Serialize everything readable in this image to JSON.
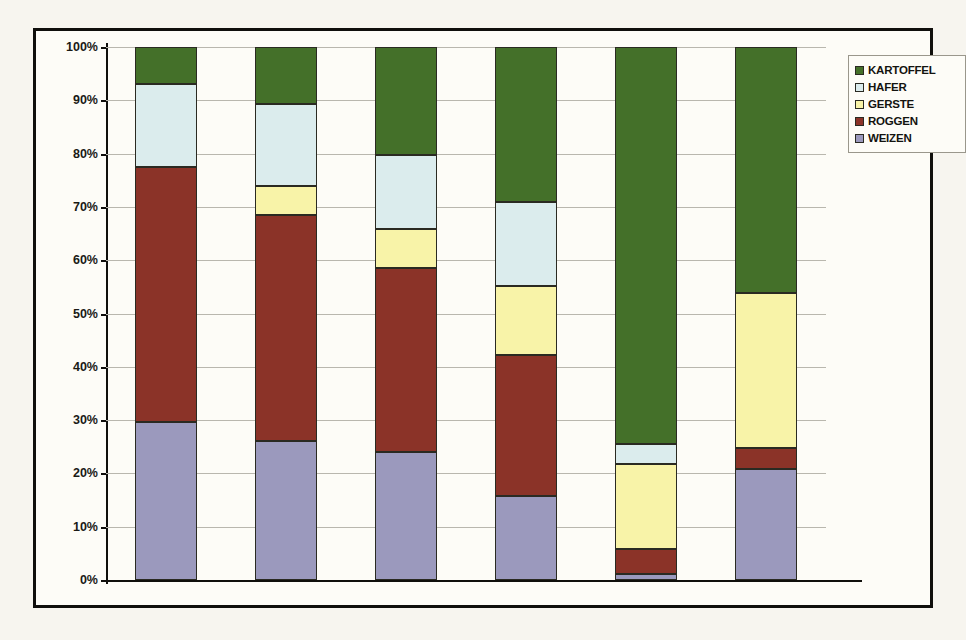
{
  "chart_data": {
    "type": "bar",
    "subtype": "stacked-100-percent",
    "title": "",
    "xlabel": "",
    "ylabel": "",
    "ylim": [
      0,
      100
    ],
    "grid": true,
    "legend_position": "right",
    "categories": [
      "1930",
      "1940",
      "1950",
      "1961",
      "1970",
      "1990"
    ],
    "y_ticks": [
      "0%",
      "10%",
      "20%",
      "30%",
      "40%",
      "50%",
      "60%",
      "70%",
      "80%",
      "90%",
      "100%"
    ],
    "y_tick_values": [
      0,
      10,
      20,
      30,
      40,
      50,
      60,
      70,
      80,
      90,
      100
    ],
    "stack_order_bottom_to_top": [
      "WEIZEN",
      "ROGGEN",
      "GERSTE",
      "HAFER",
      "KARTOFFEL"
    ],
    "series": [
      {
        "name": "WEIZEN",
        "color": "#9b99bd",
        "values": [
          29.7,
          26.1,
          24.1,
          15.7,
          1.2,
          20.8
        ]
      },
      {
        "name": "ROGGEN",
        "color": "#8b3328",
        "values": [
          47.8,
          42.4,
          34.4,
          26.6,
          4.6,
          4.0
        ]
      },
      {
        "name": "GERSTE",
        "color": "#f8f3a8",
        "values": [
          0.0,
          5.5,
          7.3,
          12.9,
          16.0,
          29.0
        ]
      },
      {
        "name": "HAFER",
        "color": "#dbeced",
        "values": [
          15.5,
          15.3,
          14.0,
          15.8,
          3.7,
          0.0
        ]
      },
      {
        "name": "KARTOFFEL",
        "color": "#447029",
        "values": [
          7.0,
          10.7,
          20.2,
          29.0,
          74.5,
          46.2
        ]
      }
    ],
    "cumulative_tops": {
      "1930": {
        "WEIZEN": 29.7,
        "ROGGEN": 77.5,
        "GERSTE": 77.5,
        "HAFER": 93.0,
        "KARTOFFEL": 100.0
      },
      "1940": {
        "WEIZEN": 26.1,
        "ROGGEN": 68.5,
        "GERSTE": 74.0,
        "HAFER": 89.3,
        "KARTOFFEL": 100.0
      },
      "1950": {
        "WEIZEN": 24.1,
        "ROGGEN": 58.5,
        "GERSTE": 65.8,
        "HAFER": 79.8,
        "KARTOFFEL": 100.0
      },
      "1961": {
        "WEIZEN": 15.7,
        "ROGGEN": 42.3,
        "GERSTE": 55.2,
        "HAFER": 71.0,
        "KARTOFFEL": 100.0
      },
      "1970": {
        "WEIZEN": 1.2,
        "ROGGEN": 5.8,
        "GERSTE": 21.8,
        "HAFER": 25.5,
        "KARTOFFEL": 100.0
      },
      "1990": {
        "WEIZEN": 20.8,
        "ROGGEN": 24.8,
        "GERSTE": 53.8,
        "HAFER": 53.8,
        "KARTOFFEL": 100.0
      }
    }
  },
  "legend": {
    "items": [
      {
        "label": "KARTOFFEL",
        "color": "#447029"
      },
      {
        "label": "HAFER",
        "color": "#dbeced"
      },
      {
        "label": "GERSTE",
        "color": "#f8f3a8"
      },
      {
        "label": "ROGGEN",
        "color": "#8b3328"
      },
      {
        "label": "WEIZEN",
        "color": "#9b99bd"
      }
    ]
  },
  "colors": {
    "frame": "#100f0c",
    "page_background": "#f7f5ef",
    "plot_background": "#fdfcf7",
    "gridline": "#b9b7ae",
    "axis": "#100f0c",
    "segment_border": "#2a2a22"
  }
}
